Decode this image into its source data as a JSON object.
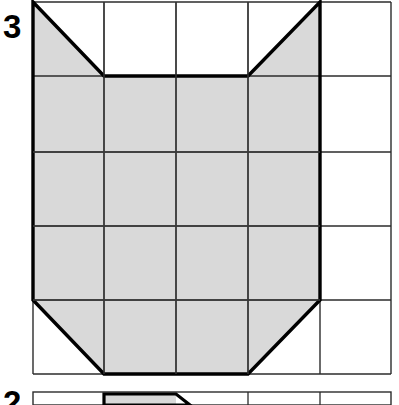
{
  "page": {
    "background_color": "#ffffff",
    "width": 399,
    "height": 405
  },
  "figures": [
    {
      "label": "3",
      "label_color": "#000000",
      "grid": {
        "columns": 5,
        "rows": 5,
        "cell_width": 71.6,
        "cell_height": 74.4,
        "origin_x": 33,
        "origin_y": 2,
        "line_color": "#1a1a1a",
        "thin_line_width": 1.4,
        "thick_line_width": 3.2,
        "shade_color": "#d9d9d9"
      },
      "shape": {
        "name": "cat-head-polygon",
        "fill_color": "#d9d9d9",
        "outline_color": "#000000",
        "outline_width": 3.2,
        "description": "Shaded region spanning columns 1 through 4 of a 5 by 5 grid, with the top-left and top-right cells of row 1 cut by diagonals forming ear notches, and the bottom-left and bottom-right cells of row 5 cut by diagonals forming a tapered chin",
        "vertices": [
          [
            33,
            2
          ],
          [
            104,
            76
          ],
          [
            248,
            76
          ],
          [
            320,
            2
          ],
          [
            320,
            300
          ],
          [
            248,
            374
          ],
          [
            104,
            374
          ],
          [
            33,
            300
          ]
        ],
        "area_cells": 16
      },
      "shaded_cells": [
        {
          "row": 1,
          "col": 1,
          "fill": "lower-left-triangle"
        },
        {
          "row": 1,
          "col": 4,
          "fill": "lower-right-triangle"
        },
        {
          "row": 2,
          "col": 1,
          "fill": "full"
        },
        {
          "row": 2,
          "col": 2,
          "fill": "full"
        },
        {
          "row": 2,
          "col": 3,
          "fill": "full"
        },
        {
          "row": 2,
          "col": 4,
          "fill": "full"
        },
        {
          "row": 3,
          "col": 1,
          "fill": "full"
        },
        {
          "row": 3,
          "col": 2,
          "fill": "full"
        },
        {
          "row": 3,
          "col": 3,
          "fill": "full"
        },
        {
          "row": 3,
          "col": 4,
          "fill": "full"
        },
        {
          "row": 4,
          "col": 1,
          "fill": "full"
        },
        {
          "row": 4,
          "col": 2,
          "fill": "full"
        },
        {
          "row": 4,
          "col": 3,
          "fill": "full"
        },
        {
          "row": 4,
          "col": 4,
          "fill": "full"
        },
        {
          "row": 5,
          "col": 1,
          "fill": "upper-right-triangle"
        },
        {
          "row": 5,
          "col": 2,
          "fill": "full"
        },
        {
          "row": 5,
          "col": 3,
          "fill": "full"
        },
        {
          "row": 5,
          "col": 4,
          "fill": "upper-left-triangle"
        }
      ],
      "empty_column": 5
    },
    {
      "label": "2",
      "label_color": "#000000",
      "clipped": true,
      "grid": {
        "columns": 5,
        "rows": 5,
        "cell_width": 71.6,
        "origin_x": 33,
        "line_color": "#1a1a1a"
      },
      "shape": {
        "name": "partial-shape-top-edge",
        "fill_color": "#d9d9d9",
        "outline_color": "#000000",
        "description": "Top edge of the next figure, shaded block spanning columns 3 and part of 4 with a small diagonal notch on its right side"
      }
    }
  ]
}
